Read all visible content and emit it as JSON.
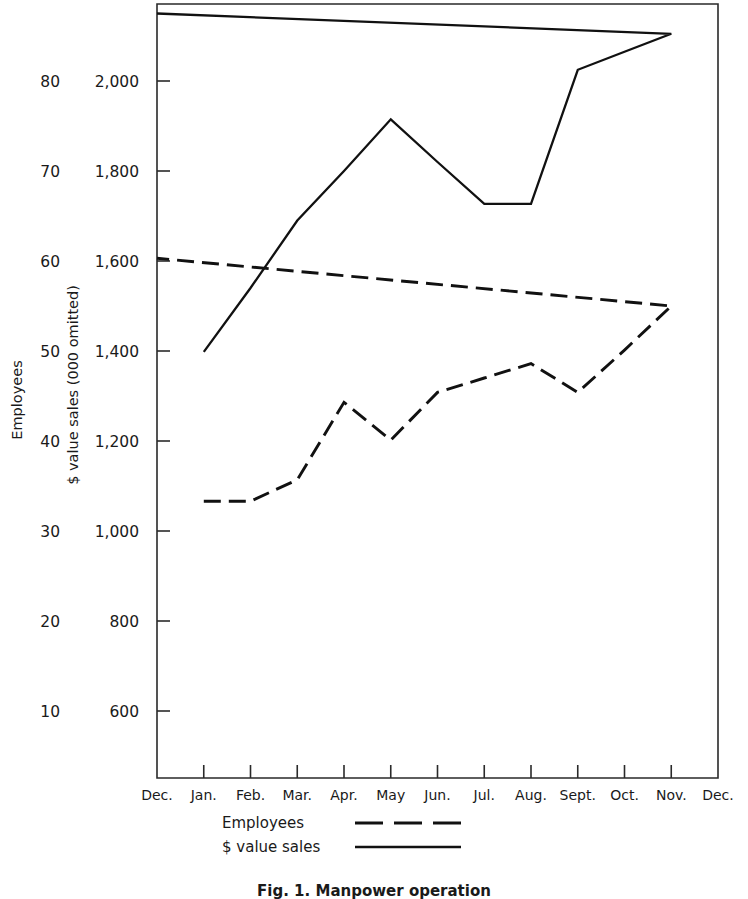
{
  "figure": {
    "caption": "Fig. 1.  Manpower operation"
  },
  "chart_data": {
    "type": "line",
    "title": "",
    "xlabel": "",
    "grid": false,
    "legend_position": "below-axis",
    "categories": [
      "Dec.",
      "Jan.",
      "Feb.",
      "Mar.",
      "Apr.",
      "May",
      "Jun.",
      "Jul.",
      "Aug.",
      "Sept.",
      "Oct.",
      "Nov.",
      "Dec."
    ],
    "axes": {
      "left_outer": {
        "label": "Employees",
        "ticks": [
          10,
          20,
          30,
          40,
          50,
          60,
          70,
          80
        ],
        "tick_labels": [
          "10",
          "20",
          "30",
          "40",
          "50",
          "60",
          "70",
          "80"
        ],
        "range": [
          0,
          85
        ]
      },
      "left_inner": {
        "label": "$ value sales (000 omitted)",
        "ticks": [
          600,
          800,
          1000,
          1200,
          1400,
          1600,
          1800,
          2000
        ],
        "tick_labels": [
          "600",
          "800",
          "1,000",
          "1,200",
          "1,400",
          "1,600",
          "1,800",
          "2,000"
        ],
        "range": [
          450,
          2200
        ]
      }
    },
    "series": [
      {
        "name": "Employees",
        "axis": "left_outer",
        "style": "dashed",
        "color": "#111111",
        "x": [
          "Jan.",
          "Feb.",
          "Mar.",
          "Apr.",
          "May",
          "Jun.",
          "Jul.",
          "Aug.",
          "Sept.",
          "Oct.",
          "Nov.",
          "Dec."
        ],
        "values": [
          33.3,
          33.3,
          35.7,
          44.3,
          40.1,
          45.4,
          47.0,
          48.6,
          45.4,
          50.1,
          55.0,
          60.3
        ]
      },
      {
        "name": "$ value sales",
        "axis": "left_inner",
        "style": "solid",
        "color": "#111111",
        "x": [
          "Jan.",
          "Feb.",
          "Mar.",
          "Apr.",
          "May",
          "Jun.",
          "Jul.",
          "Aug.",
          "Sept.",
          "Oct.",
          "Nov.",
          "Dec."
        ],
        "values": [
          1398,
          1540,
          1690,
          1800,
          1915,
          1820,
          1727,
          1727,
          2025,
          2065,
          2105,
          2150
        ]
      }
    ],
    "legend": [
      {
        "label": "Employees",
        "style": "dashed"
      },
      {
        "label": "$ value sales",
        "style": "solid"
      }
    ]
  }
}
